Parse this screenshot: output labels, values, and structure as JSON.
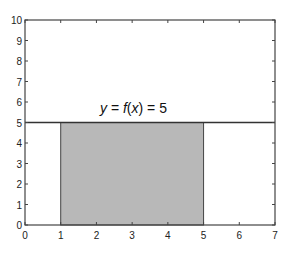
{
  "chart_data": {
    "type": "area",
    "title": "",
    "xlabel": "",
    "ylabel": "",
    "xlim": [
      0,
      7
    ],
    "ylim": [
      0,
      10
    ],
    "grid": false,
    "x_ticks": [
      "0",
      "1",
      "2",
      "3",
      "4",
      "5",
      "6",
      "7"
    ],
    "y_ticks": [
      "0",
      "1",
      "2",
      "3",
      "4",
      "5",
      "6",
      "7",
      "8",
      "9",
      "10"
    ],
    "series": [
      {
        "name": "y = f(x) = 5",
        "type": "line",
        "x": [
          0,
          7
        ],
        "y": [
          5,
          5
        ],
        "color": "#333333"
      },
      {
        "name": "shaded area",
        "type": "area",
        "x": [
          1,
          5
        ],
        "y": [
          5,
          5
        ],
        "color": "#b8b8b8"
      }
    ],
    "annotations": [
      {
        "text_parts": [
          "y",
          " = ",
          "f",
          "(",
          "x",
          ") = 5"
        ],
        "x": 2.1,
        "y": 5.5
      }
    ]
  }
}
